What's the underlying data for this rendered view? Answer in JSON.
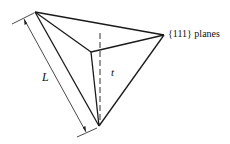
{
  "diagram": {
    "type": "tetrahedral-pyramid",
    "labels": {
      "planes": "{111} planes",
      "length": "L",
      "thickness": "t"
    },
    "colors": {
      "stroke": "#1a1a1a",
      "background": "#ffffff"
    }
  }
}
